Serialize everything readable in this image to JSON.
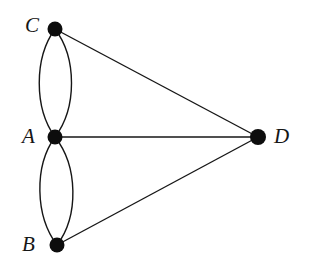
{
  "figure": {
    "kind": "undirected-multigraph-diagram",
    "background_color": "#ffffff",
    "ink_color": "#161616",
    "width": 309,
    "height": 270
  },
  "graph": {
    "vertices": [
      {
        "id": "C",
        "label": "C",
        "x": 55,
        "y": 29,
        "radius": 7,
        "label_side": "left"
      },
      {
        "id": "A",
        "label": "A",
        "x": 55,
        "y": 137,
        "radius": 7,
        "label_side": "left"
      },
      {
        "id": "B",
        "label": "B",
        "x": 57,
        "y": 245,
        "radius": 7,
        "label_side": "left"
      },
      {
        "id": "D",
        "label": "D",
        "x": 258,
        "y": 137,
        "radius": 8,
        "label_side": "right"
      }
    ],
    "edges": [
      {
        "id": "CA-left",
        "from": "C",
        "to": "A",
        "style": "curved",
        "bulge": -21
      },
      {
        "id": "CA-right",
        "from": "C",
        "to": "A",
        "style": "curved",
        "bulge": 21
      },
      {
        "id": "AB-left",
        "from": "A",
        "to": "B",
        "style": "curved",
        "bulge": -21
      },
      {
        "id": "AB-right",
        "from": "A",
        "to": "B",
        "style": "curved",
        "bulge": 21
      },
      {
        "id": "CD",
        "from": "C",
        "to": "D",
        "style": "straight",
        "bulge": 0
      },
      {
        "id": "AD",
        "from": "A",
        "to": "D",
        "style": "straight",
        "bulge": 0
      },
      {
        "id": "BD",
        "from": "B",
        "to": "D",
        "style": "straight",
        "bulge": 0
      }
    ],
    "edge_stroke_width": 1.4,
    "degree_summary": {
      "A": 5,
      "B": 3,
      "C": 3,
      "D": 3
    }
  }
}
